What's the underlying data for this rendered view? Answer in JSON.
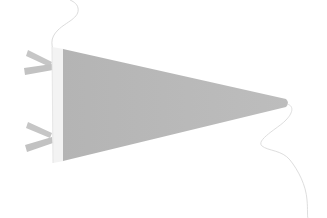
{
  "image": {
    "subject": "Blank gray felt pennant flag with white left band, two side ties and hanging strings",
    "colors": {
      "background": "#ffffff",
      "pennant_felt": "#b9b9b9",
      "pennant_band": "#f4f4f4",
      "ties": "#c4c4c4",
      "string": "#dedede"
    }
  }
}
